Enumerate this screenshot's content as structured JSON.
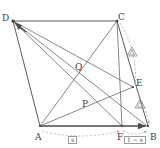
{
  "figure": {
    "type": "geometry-diagram",
    "width": 160,
    "height": 148,
    "background": "#ffffff",
    "stroke_solid": "#5a5a5a",
    "stroke_dashed": "#a8a8a8",
    "text_color": "#3a3a3a"
  },
  "vertices": [
    {
      "id": "D",
      "label": "D",
      "x": 13,
      "y": 21,
      "label_x": 2,
      "label_y": 14
    },
    {
      "id": "C",
      "label": "C",
      "x": 117,
      "y": 21,
      "label_x": 118,
      "label_y": 13
    },
    {
      "id": "A",
      "label": "A",
      "x": 40,
      "y": 126,
      "label_x": 35,
      "label_y": 133
    },
    {
      "id": "B",
      "label": "B",
      "x": 148,
      "y": 126,
      "label_x": 150,
      "label_y": 133
    },
    {
      "id": "E",
      "label": "E",
      "x": 133,
      "y": 87,
      "label_x": 136,
      "label_y": 79
    },
    {
      "id": "F",
      "label": "F",
      "x": 122,
      "y": 126,
      "label_x": 118,
      "label_y": 133
    },
    {
      "id": "P",
      "label": "P",
      "x": 86,
      "y": 107,
      "label_x": 82,
      "label_y": 100
    },
    {
      "id": "Q",
      "label": "Q",
      "x": 79,
      "y": 71,
      "label_x": 75,
      "label_y": 63
    }
  ],
  "segments": [
    {
      "name": "segment-DC",
      "from": "D",
      "to": "C",
      "style": "solid"
    },
    {
      "name": "segment-DA",
      "from": "D",
      "to": "A",
      "style": "solid"
    },
    {
      "name": "segment-CB",
      "from": "C",
      "to": "B",
      "style": "solid"
    },
    {
      "name": "segment-AB",
      "from": "A",
      "to": "B",
      "style": "solid-arrow"
    },
    {
      "name": "segment-DB",
      "from": "D",
      "to": "B",
      "style": "solid"
    },
    {
      "name": "segment-DF",
      "from": "D",
      "to": "F",
      "style": "solid"
    },
    {
      "name": "segment-DE",
      "from": "D",
      "to": "E",
      "style": "solid"
    },
    {
      "name": "segment-AC",
      "from": "A",
      "to": "C",
      "style": "solid"
    },
    {
      "name": "segment-AE",
      "from": "A",
      "to": "E",
      "style": "solid"
    },
    {
      "name": "segment-CF",
      "from": "C",
      "to": "F",
      "style": "solid"
    }
  ],
  "measure_arcs": [
    {
      "name": "arc-A-to-F",
      "style": "dashed"
    },
    {
      "name": "arc-F-to-B",
      "style": "dashed"
    },
    {
      "name": "arc-C-to-E",
      "style": "dashed"
    },
    {
      "name": "arc-E-to-B",
      "style": "dashed"
    }
  ],
  "segment_labels": [
    {
      "name": "label-s",
      "text": "s",
      "x": 68,
      "y": 136
    },
    {
      "name": "label-1-minus-s",
      "text": "1 − s",
      "x": 126,
      "y": 136
    }
  ],
  "tick_marks": [
    {
      "name": "congruence-tick-CE",
      "x": 132,
      "y": 52,
      "glyph": "triangle"
    },
    {
      "name": "congruence-tick-EB",
      "x": 140,
      "y": 104,
      "glyph": "triangle"
    }
  ]
}
